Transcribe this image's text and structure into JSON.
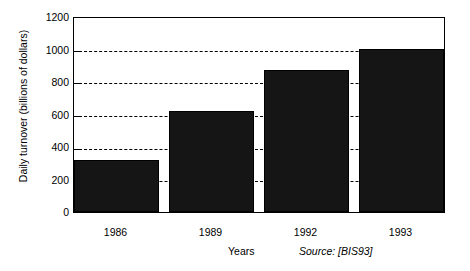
{
  "chart_data": {
    "type": "bar",
    "title": "",
    "subtitle": "",
    "xlabel": "Years",
    "ylabel": "Daily turnover (billions of dollars)",
    "categories": [
      "1986",
      "1989",
      "1992",
      "1993"
    ],
    "values": [
      320,
      630,
      880,
      1010
    ],
    "series": [
      {
        "name": "Daily turnover",
        "values": [
          320,
          630,
          880,
          1010
        ]
      }
    ],
    "ylim": [
      0,
      1200
    ],
    "yticks": [
      1200,
      1000,
      800,
      600,
      400,
      200,
      0
    ],
    "ytick_labels": [
      "1200",
      "1000",
      "800",
      "600",
      "400",
      "200",
      "0"
    ],
    "grid": "horizontal-dashed",
    "legend": "none",
    "annotations": [
      "Source: [BIS93]"
    ],
    "bar_color": "#151515",
    "axis_color": "#000000",
    "background_color": "#ffffff"
  },
  "annotation": {
    "source": "Source: [BIS93]"
  }
}
